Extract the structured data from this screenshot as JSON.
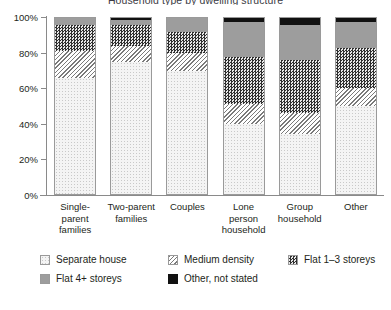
{
  "chart_data": {
    "type": "bar",
    "stacked": true,
    "normalized": "100%",
    "title": "Household type by dwelling structure",
    "xlabel": "",
    "ylabel": "",
    "ylim": [
      0,
      100
    ],
    "ytick_values": [
      0,
      20,
      40,
      60,
      80,
      100
    ],
    "ytick_labels": [
      "0%",
      "20%",
      "40%",
      "60%",
      "80%",
      "100%"
    ],
    "grid": false,
    "legend_position": "bottom",
    "categories": [
      "Single-parent families",
      "Two-parent families",
      "Couples",
      "Lone person household",
      "Group household",
      "Other"
    ],
    "category_label_lines": [
      [
        "Single-",
        "parent",
        "families"
      ],
      [
        "Two-parent",
        "families"
      ],
      [
        "Couples"
      ],
      [
        "Lone",
        "person",
        "household"
      ],
      [
        "Group",
        "household"
      ],
      [
        "Other"
      ]
    ],
    "series": [
      {
        "name": "Separate house",
        "pattern": "pat-separate",
        "values": [
          66,
          75,
          70,
          40,
          34,
          50
        ]
      },
      {
        "name": "Medium density",
        "pattern": "pat-medium",
        "values": [
          15,
          9,
          10,
          11,
          12,
          10
        ]
      },
      {
        "name": "Flat 1–3 storeys",
        "pattern": "pat-flat13",
        "values": [
          15,
          12,
          12,
          27,
          30,
          23
        ]
      },
      {
        "name": "Flat 4+ storeys",
        "pattern": "pat-flat4",
        "values": [
          4,
          3,
          8,
          20,
          20,
          15
        ]
      },
      {
        "name": "Other, not stated",
        "pattern": "pat-other",
        "values": [
          0,
          1,
          0,
          2,
          4,
          2
        ]
      }
    ]
  },
  "legend": {
    "items": [
      {
        "label": "Separate house",
        "pattern": "pat-separate"
      },
      {
        "label": "Medium density",
        "pattern": "pat-medium"
      },
      {
        "label": "Flat 1–3 storeys",
        "pattern": "pat-flat13"
      },
      {
        "label": "Flat 4+ storeys",
        "pattern": "pat-flat4"
      },
      {
        "label": "Other, not stated",
        "pattern": "pat-other"
      }
    ]
  }
}
